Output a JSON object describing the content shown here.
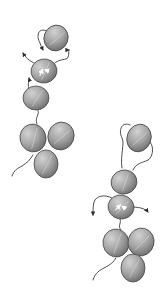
{
  "diagram": {
    "type": "molecular-domain-schematic",
    "background": "#ffffff",
    "colors": {
      "domain_fill_light": "#c4c4c4",
      "domain_fill_dark": "#7a7a7a",
      "domain_stroke": "#4a4a4a",
      "linker": "#3a3a3a",
      "inner_arrow": "#ffffff"
    },
    "assemblies": [
      {
        "name": "left-assembly",
        "trefoil": [
          {
            "cx": 33,
            "cy": 138,
            "rx": 13,
            "ry": 14,
            "rot": -15
          },
          {
            "cx": 61,
            "cy": 136,
            "rx": 13,
            "ry": 14,
            "rot": 20
          },
          {
            "cx": 46,
            "cy": 164,
            "rx": 12,
            "ry": 14,
            "rot": 0
          }
        ],
        "chain": [
          {
            "cx": 56,
            "cy": 38,
            "rx": 12,
            "ry": 13,
            "rot": 20,
            "label": "top-domain"
          },
          {
            "cx": 44,
            "cy": 71,
            "rx": 13,
            "ry": 12,
            "rot": -10,
            "label": "middle-domain",
            "inner_arrows": true
          },
          {
            "cx": 36,
            "cy": 98,
            "rx": 13,
            "ry": 12,
            "rot": 0,
            "label": "lower-domain"
          }
        ],
        "tail": "M12,176 C14,170 18,168 22,166 C27,163 30,160 33,155",
        "linkers": [
          {
            "d": "M38,110 C40,115 34,118 37,124",
            "arrow": false
          },
          {
            "d": "M30,90 C26,85 30,82 29,78",
            "arrow": true
          },
          {
            "d": "M36,64 C28,60 26,58 23,53",
            "arrow": true
          },
          {
            "d": "M47,31 C38,27 36,36 40,43 C41,46 42,48 43,50",
            "arrow": true
          },
          {
            "d": "M52,66 C56,60 62,60 66,59 C70,58 68,50 69,50",
            "arrow": true
          }
        ]
      },
      {
        "name": "right-assembly",
        "trefoil": [
          {
            "cx": 116,
            "cy": 243,
            "rx": 13,
            "ry": 14,
            "rot": -10
          },
          {
            "cx": 141,
            "cy": 242,
            "rx": 13,
            "ry": 14,
            "rot": 15
          },
          {
            "cx": 133,
            "cy": 268,
            "rx": 12,
            "ry": 14,
            "rot": 0
          }
        ],
        "chain": [
          {
            "cx": 139,
            "cy": 138,
            "rx": 12,
            "ry": 14,
            "rot": 20,
            "label": "top-domain"
          },
          {
            "cx": 124,
            "cy": 182,
            "rx": 13,
            "ry": 12,
            "rot": -15,
            "label": "middle-domain"
          },
          {
            "cx": 121,
            "cy": 207,
            "rx": 13,
            "ry": 12,
            "rot": 10,
            "label": "lower-domain",
            "inner_arrows": true
          }
        ],
        "tail": "M93,280 C95,273 100,270 104,268 C110,265 114,262 116,258",
        "linkers": [
          {
            "d": "M120,219 C122,223 117,226 121,230",
            "arrow": false
          },
          {
            "d": "M130,125 C122,121 118,130 122,138 C125,143 120,155 122,168",
            "arrow": false
          },
          {
            "d": "M150,142 C155,148 152,158 148,160 C142,163 136,163 133,170",
            "arrow": false
          },
          {
            "d": "M112,198 C104,194 96,196 94,202 C93,206 93,210 93,215",
            "arrow": true
          },
          {
            "d": "M131,207 C138,207 145,208 148,212",
            "arrow": true
          }
        ]
      }
    ]
  }
}
